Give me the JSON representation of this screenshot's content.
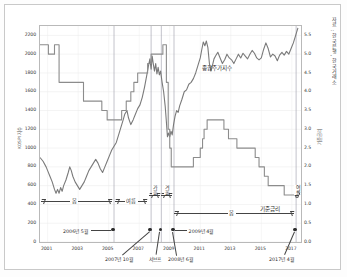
{
  "credit": "자료 : 한국은행, 한국거래소",
  "chart_data": {
    "type": "line",
    "title": "",
    "xlabel": "",
    "ylabel": "KOSPI 지수",
    "y2label": "기준금리",
    "grid": true,
    "legend_position": "inline",
    "xlim": [
      2000.5,
      2017.6
    ],
    "ylim": [
      0,
      2300
    ],
    "y2lim": [
      0.0,
      5.75
    ],
    "yticks": [
      0,
      200,
      400,
      600,
      800,
      1000,
      1200,
      1400,
      1600,
      1800,
      2000,
      2200
    ],
    "y2ticks": [
      "0.0",
      "0.5",
      "1.0",
      "1.5",
      "2.0",
      "2.5",
      "3.0",
      "3.5",
      "4.0",
      "4.5",
      "5.0",
      "5.5"
    ],
    "xticks": [
      "2001",
      "2003",
      "2005",
      "2007",
      "2009",
      "2011",
      "2013",
      "2015",
      "2017"
    ],
    "series": [
      {
        "name": "종합주가지수",
        "axis": "left",
        "color": "#7a7a7a",
        "points": [
          [
            2000.5,
            900
          ],
          [
            2000.7,
            860
          ],
          [
            2000.9,
            800
          ],
          [
            2001.0,
            760
          ],
          [
            2001.15,
            700
          ],
          [
            2001.3,
            640
          ],
          [
            2001.45,
            560
          ],
          [
            2001.55,
            520
          ],
          [
            2001.65,
            560
          ],
          [
            2001.75,
            520
          ],
          [
            2001.85,
            580
          ],
          [
            2001.95,
            540
          ],
          [
            2002.05,
            600
          ],
          [
            2002.2,
            660
          ],
          [
            2002.35,
            740
          ],
          [
            2002.45,
            800
          ],
          [
            2002.55,
            760
          ],
          [
            2002.65,
            700
          ],
          [
            2002.8,
            640
          ],
          [
            2002.95,
            600
          ],
          [
            2003.1,
            560
          ],
          [
            2003.25,
            600
          ],
          [
            2003.4,
            640
          ],
          [
            2003.55,
            700
          ],
          [
            2003.7,
            760
          ],
          [
            2003.85,
            800
          ],
          [
            2004.0,
            840
          ],
          [
            2004.15,
            880
          ],
          [
            2004.3,
            840
          ],
          [
            2004.45,
            780
          ],
          [
            2004.6,
            740
          ],
          [
            2004.75,
            800
          ],
          [
            2004.9,
            860
          ],
          [
            2005.05,
            920
          ],
          [
            2005.2,
            980
          ],
          [
            2005.35,
            1020
          ],
          [
            2005.5,
            1060
          ],
          [
            2005.65,
            1140
          ],
          [
            2005.8,
            1220
          ],
          [
            2005.95,
            1300
          ],
          [
            2006.05,
            1360
          ],
          [
            2006.2,
            1400
          ],
          [
            2006.3,
            1320
          ],
          [
            2006.45,
            1250
          ],
          [
            2006.6,
            1300
          ],
          [
            2006.75,
            1360
          ],
          [
            2006.9,
            1420
          ],
          [
            2007.05,
            1460
          ],
          [
            2007.2,
            1540
          ],
          [
            2007.35,
            1650
          ],
          [
            2007.5,
            1780
          ],
          [
            2007.6,
            1870
          ],
          [
            2007.7,
            1950
          ],
          [
            2007.78,
            1840
          ],
          [
            2007.85,
            1980
          ],
          [
            2007.92,
            1900
          ],
          [
            2008.0,
            1820
          ],
          [
            2008.08,
            1900
          ],
          [
            2008.16,
            1790
          ],
          [
            2008.24,
            1860
          ],
          [
            2008.32,
            1780
          ],
          [
            2008.4,
            1820
          ],
          [
            2008.5,
            1700
          ],
          [
            2008.6,
            1600
          ],
          [
            2008.7,
            1450
          ],
          [
            2008.78,
            1280
          ],
          [
            2008.85,
            1120
          ],
          [
            2008.92,
            1160
          ],
          [
            2009.0,
            1120
          ],
          [
            2009.08,
            1180
          ],
          [
            2009.16,
            1140
          ],
          [
            2009.25,
            1250
          ],
          [
            2009.35,
            1340
          ],
          [
            2009.45,
            1400
          ],
          [
            2009.55,
            1380
          ],
          [
            2009.65,
            1450
          ],
          [
            2009.8,
            1520
          ],
          [
            2009.95,
            1600
          ],
          [
            2010.1,
            1620
          ],
          [
            2010.25,
            1680
          ],
          [
            2010.4,
            1700
          ],
          [
            2010.55,
            1740
          ],
          [
            2010.7,
            1800
          ],
          [
            2010.85,
            1880
          ],
          [
            2011.0,
            1960
          ],
          [
            2011.1,
            2050
          ],
          [
            2011.2,
            2130
          ],
          [
            2011.3,
            2090
          ],
          [
            2011.4,
            2140
          ],
          [
            2011.5,
            2070
          ],
          [
            2011.6,
            1900
          ],
          [
            2011.7,
            1820
          ],
          [
            2011.8,
            1880
          ],
          [
            2011.9,
            1950
          ],
          [
            2012.0,
            1980
          ],
          [
            2012.15,
            2020
          ],
          [
            2012.3,
            1960
          ],
          [
            2012.45,
            1900
          ],
          [
            2012.6,
            1940
          ],
          [
            2012.75,
            2000
          ],
          [
            2012.9,
            1960
          ],
          [
            2013.05,
            1940
          ],
          [
            2013.2,
            1900
          ],
          [
            2013.35,
            1950
          ],
          [
            2013.5,
            2000
          ],
          [
            2013.65,
            1960
          ],
          [
            2013.8,
            2010
          ],
          [
            2013.95,
            1980
          ],
          [
            2014.1,
            1950
          ],
          [
            2014.25,
            2000
          ],
          [
            2014.4,
            2040
          ],
          [
            2014.55,
            2010
          ],
          [
            2014.7,
            1960
          ],
          [
            2014.85,
            1940
          ],
          [
            2015.0,
            1960
          ],
          [
            2015.15,
            2050
          ],
          [
            2015.3,
            2120
          ],
          [
            2015.45,
            2060
          ],
          [
            2015.6,
            1970
          ],
          [
            2015.75,
            2000
          ],
          [
            2015.9,
            1980
          ],
          [
            2016.05,
            1930
          ],
          [
            2016.2,
            1990
          ],
          [
            2016.35,
            2020
          ],
          [
            2016.5,
            1990
          ],
          [
            2016.65,
            2030
          ],
          [
            2016.8,
            2000
          ],
          [
            2016.95,
            2060
          ],
          [
            2017.1,
            2120
          ],
          [
            2017.25,
            2200
          ],
          [
            2017.4,
            2280
          ]
        ]
      },
      {
        "name": "기준금리",
        "axis": "right",
        "color": "#8c8c8c",
        "steps": [
          [
            2000.5,
            5.25
          ],
          [
            2001.0,
            5.25
          ],
          [
            2001.05,
            5.0
          ],
          [
            2001.4,
            5.0
          ],
          [
            2001.45,
            5.25
          ],
          [
            2001.7,
            5.25
          ],
          [
            2001.75,
            4.25
          ],
          [
            2002.2,
            4.25
          ],
          [
            2002.25,
            4.25
          ],
          [
            2002.6,
            4.25
          ],
          [
            2002.65,
            4.25
          ],
          [
            2003.0,
            4.25
          ],
          [
            2003.05,
            4.25
          ],
          [
            2003.3,
            4.25
          ],
          [
            2003.35,
            3.75
          ],
          [
            2003.8,
            3.75
          ],
          [
            2003.85,
            3.75
          ],
          [
            2004.5,
            3.75
          ],
          [
            2004.55,
            3.5
          ],
          [
            2004.85,
            3.5
          ],
          [
            2004.9,
            3.25
          ],
          [
            2005.8,
            3.25
          ],
          [
            2005.85,
            3.5
          ],
          [
            2006.1,
            3.5
          ],
          [
            2006.15,
            3.75
          ],
          [
            2006.4,
            3.75
          ],
          [
            2006.45,
            4.0
          ],
          [
            2006.6,
            4.0
          ],
          [
            2006.65,
            4.25
          ],
          [
            2006.85,
            4.25
          ],
          [
            2006.9,
            4.5
          ],
          [
            2007.5,
            4.5
          ],
          [
            2007.55,
            4.75
          ],
          [
            2007.7,
            4.75
          ],
          [
            2007.78,
            5.0
          ],
          [
            2008.5,
            5.0
          ],
          [
            2008.55,
            5.25
          ],
          [
            2008.72,
            5.25
          ],
          [
            2008.78,
            4.25
          ],
          [
            2008.9,
            3.0
          ],
          [
            2009.0,
            2.5
          ],
          [
            2009.1,
            2.0
          ],
          [
            2010.5,
            2.0
          ],
          [
            2010.55,
            2.25
          ],
          [
            2010.85,
            2.25
          ],
          [
            2011.0,
            2.5
          ],
          [
            2011.15,
            2.75
          ],
          [
            2011.25,
            3.0
          ],
          [
            2011.45,
            3.25
          ],
          [
            2012.4,
            3.25
          ],
          [
            2012.55,
            3.0
          ],
          [
            2012.85,
            2.75
          ],
          [
            2013.4,
            2.5
          ],
          [
            2014.6,
            2.25
          ],
          [
            2014.85,
            2.0
          ],
          [
            2015.2,
            1.75
          ],
          [
            2015.45,
            1.5
          ],
          [
            2016.5,
            1.25
          ],
          [
            2017.45,
            1.25
          ]
        ]
      }
    ],
    "vertical_markers": [
      2005.35,
      2007.78,
      2008.45,
      2009.28,
      2017.28
    ],
    "annotations": [
      {
        "label": "종합주가지수",
        "x": 2012.1,
        "y": 1830
      },
      {
        "label": "기준금리",
        "x": 2015.6,
        "y": 330
      }
    ]
  },
  "seasons": [
    {
      "label": "봄",
      "orientation": "h",
      "from": 2000.6,
      "to": 2005.3
    },
    {
      "label": "여름",
      "orientation": "h",
      "from": 2005.45,
      "to": 2007.6
    },
    {
      "label": "가을",
      "orientation": "v",
      "from": 2007.7,
      "to": 2008.4
    },
    {
      "label": "겨울",
      "orientation": "v",
      "from": 2008.5,
      "to": 2009.2
    },
    {
      "label": "봄",
      "orientation": "h",
      "from": 2009.35,
      "to": 2017.2
    },
    {
      "label": "여름",
      "orientation": "v",
      "from": 2017.3,
      "to": 2017.5
    }
  ],
  "event_labels": {
    "e1": "2006년 5월",
    "e2": "2007년 10월",
    "e3": "서브프",
    "e4": "2008년 6월",
    "e5": "2009년 4월",
    "e6": "2017년 4월"
  }
}
